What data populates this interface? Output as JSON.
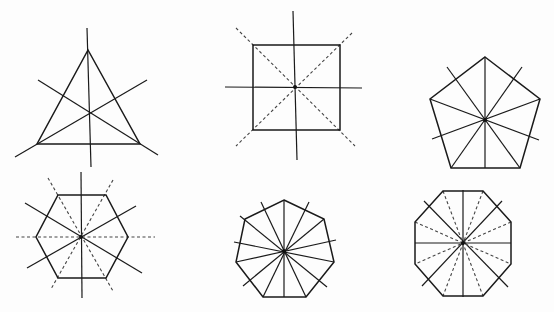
{
  "figure": {
    "colors": {
      "background": "#fdfdfd",
      "line": "#1a1a1a",
      "dashed": "#444444"
    },
    "shapes": [
      {
        "id": "triangle",
        "name": "equilateral-triangle",
        "sides": 3,
        "symmetry_lines": 3,
        "vertices": [
          [
            88,
            50
          ],
          [
            140,
            144
          ],
          [
            37,
            144
          ]
        ],
        "center": [
          89,
          113
        ],
        "lines": [
          {
            "from": [
              87,
              28
            ],
            "to": [
              91,
              167
            ],
            "style": "solid"
          },
          {
            "from": [
              38,
              80
            ],
            "to": [
              158,
              155
            ],
            "style": "solid"
          },
          {
            "from": [
              147,
              80
            ],
            "to": [
              15,
              157
            ],
            "style": "solid"
          }
        ],
        "center_dot": false
      },
      {
        "id": "square",
        "name": "square",
        "sides": 4,
        "symmetry_lines": 4,
        "vertices": [
          [
            253,
            45
          ],
          [
            340,
            45
          ],
          [
            340,
            130
          ],
          [
            253,
            130
          ]
        ],
        "center": [
          295,
          87
        ],
        "lines": [
          {
            "from": [
              293,
              11
            ],
            "to": [
              297,
              160
            ],
            "style": "solid"
          },
          {
            "from": [
              225,
              87
            ],
            "to": [
              362,
              88
            ],
            "style": "solid"
          },
          {
            "from": [
              236,
              28
            ],
            "to": [
              355,
              146
            ],
            "style": "dashed"
          },
          {
            "from": [
              352,
              33
            ],
            "to": [
              236,
              146
            ],
            "style": "dashed"
          }
        ],
        "center_dot": true
      },
      {
        "id": "pentagon",
        "name": "regular-pentagon",
        "sides": 5,
        "symmetry_lines": 5,
        "vertices": [
          [
            485,
            57
          ],
          [
            540,
            99
          ],
          [
            520,
            168
          ],
          [
            451,
            168
          ],
          [
            430,
            99
          ]
        ],
        "center": [
          485,
          120
        ],
        "lines": [
          {
            "from": [
              485,
              57
            ],
            "to": [
              485,
              168
            ],
            "style": "solid"
          },
          {
            "from": [
              447,
              67
            ],
            "to": [
              520,
              168
            ],
            "style": "solid"
          },
          {
            "from": [
              522,
              67
            ],
            "to": [
              451,
              168
            ],
            "style": "solid"
          },
          {
            "from": [
              430,
              99
            ],
            "to": [
              539,
              140
            ],
            "style": "solid"
          },
          {
            "from": [
              540,
              99
            ],
            "to": [
              432,
              139
            ],
            "style": "solid"
          }
        ],
        "center_dot": true
      },
      {
        "id": "hexagon",
        "name": "regular-hexagon",
        "sides": 6,
        "symmetry_lines": 6,
        "vertices": [
          [
            58,
            195
          ],
          [
            106,
            195
          ],
          [
            128,
            237
          ],
          [
            106,
            278
          ],
          [
            58,
            278
          ],
          [
            36,
            237
          ]
        ],
        "center": [
          81,
          237
        ],
        "lines": [
          {
            "from": [
              81,
              172
            ],
            "to": [
              82,
              298
            ],
            "style": "solid"
          },
          {
            "from": [
              25,
              203
            ],
            "to": [
              142,
              273
            ],
            "style": "solid"
          },
          {
            "from": [
              27,
              268
            ],
            "to": [
              136,
              206
            ],
            "style": "solid"
          },
          {
            "from": [
              16,
              237
            ],
            "to": [
              155,
              237
            ],
            "style": "dashed"
          },
          {
            "from": [
              48,
              178
            ],
            "to": [
              113,
              291
            ],
            "style": "dashed"
          },
          {
            "from": [
              113,
              180
            ],
            "to": [
              51,
              289
            ],
            "style": "dashed"
          }
        ],
        "center_dot": true
      },
      {
        "id": "heptagon",
        "name": "regular-heptagon",
        "sides": 7,
        "symmetry_lines": 7,
        "vertices": [
          [
            284,
            200
          ],
          [
            324,
            219
          ],
          [
            334,
            262
          ],
          [
            306,
            297
          ],
          [
            263,
            297
          ],
          [
            236,
            262
          ],
          [
            245,
            219
          ]
        ],
        "center": [
          284,
          251
        ],
        "lines": [
          {
            "from": [
              284,
              200
            ],
            "to": [
              284,
              297
            ],
            "style": "solid"
          },
          {
            "from": [
              261,
              202
            ],
            "to": [
              306,
              297
            ],
            "style": "solid"
          },
          {
            "from": [
              309,
              202
            ],
            "to": [
              263,
              297
            ],
            "style": "solid"
          },
          {
            "from": [
              240,
              216
            ],
            "to": [
              327,
              287
            ],
            "style": "solid"
          },
          {
            "from": [
              324,
              219
            ],
            "to": [
              243,
              286
            ],
            "style": "solid"
          },
          {
            "from": [
              234,
              242
            ],
            "to": [
              334,
              262
            ],
            "style": "solid"
          },
          {
            "from": [
              236,
              262
            ],
            "to": [
              336,
              240
            ],
            "style": "solid"
          }
        ],
        "center_dot": true
      },
      {
        "id": "octagon",
        "name": "regular-octagon",
        "sides": 8,
        "symmetry_lines": 8,
        "vertices": [
          [
            443,
            191
          ],
          [
            483,
            191
          ],
          [
            511,
            222
          ],
          [
            511,
            264
          ],
          [
            483,
            296
          ],
          [
            443,
            296
          ],
          [
            415,
            264
          ],
          [
            415,
            222
          ]
        ],
        "center": [
          463,
          243
        ],
        "lines": [
          {
            "from": [
              463,
              190
            ],
            "to": [
              463,
              297
            ],
            "style": "solid"
          },
          {
            "from": [
              415,
              243
            ],
            "to": [
              511,
              243
            ],
            "style": "solid"
          },
          {
            "from": [
              424,
              201
            ],
            "to": [
              508,
              287
            ],
            "style": "solid"
          },
          {
            "from": [
              502,
              201
            ],
            "to": [
              422,
              286
            ],
            "style": "solid"
          },
          {
            "from": [
              443,
              191
            ],
            "to": [
              483,
              296
            ],
            "style": "dashed"
          },
          {
            "from": [
              483,
              191
            ],
            "to": [
              443,
              296
            ],
            "style": "dashed"
          },
          {
            "from": [
              415,
              222
            ],
            "to": [
              511,
              264
            ],
            "style": "dashed"
          },
          {
            "from": [
              511,
              222
            ],
            "to": [
              415,
              264
            ],
            "style": "dashed"
          }
        ],
        "center_dot": true
      }
    ]
  }
}
